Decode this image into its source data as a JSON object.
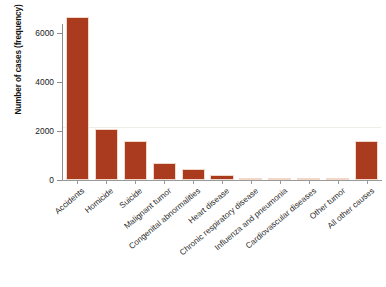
{
  "chart_data": {
    "type": "bar",
    "title": "",
    "xlabel": "",
    "ylabel": "Number of cases (frequency)",
    "categories": [
      "Accidents",
      "Homicide",
      "Suicide",
      "Malignant tumor",
      "Congenital abnormalities",
      "Heart disease",
      "Chronic respiratory disease",
      "Influenza and pneumonia",
      "Cardiovascular diseases",
      "Other tumor",
      "All other causes"
    ],
    "values": [
      6650,
      2080,
      1590,
      700,
      430,
      190,
      80,
      50,
      40,
      20,
      1590
    ],
    "ylim": [
      0,
      7000
    ],
    "yticks": [
      0,
      2000,
      4000,
      6000
    ],
    "ytick_labels": [
      "0",
      "2000",
      "4000",
      "6000"
    ],
    "grid": false,
    "legend": null,
    "bar_color": "#aa3b1e",
    "bar_edge_color": "#f2d8c8",
    "axis_color": "#8c8c8c"
  },
  "axis": {
    "y_title": "Number of cases (frequency)"
  },
  "caption": {
    "text": ""
  }
}
